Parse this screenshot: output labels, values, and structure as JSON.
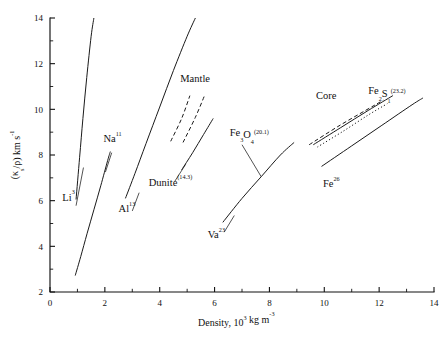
{
  "chart_data": {
    "type": "line",
    "title": "",
    "xlabel": "Density, 10^3 kg m^-3",
    "ylabel": "(κ_s/ρ) km s^-1",
    "xlim": [
      0,
      14
    ],
    "ylim": [
      2,
      14
    ],
    "xticks": [
      0,
      2,
      4,
      6,
      8,
      10,
      12,
      14
    ],
    "xticks_minor": [
      1,
      3,
      5,
      7,
      9,
      11,
      13
    ],
    "yticks": [
      2,
      4,
      6,
      8,
      10,
      12,
      14
    ],
    "yticks_minor": [
      3,
      5,
      7,
      9,
      11,
      13
    ],
    "grid": false,
    "legend": "none (inline labels with leader lines)",
    "series": [
      {
        "name": "Li3",
        "style": "solid",
        "points": [
          [
            0.95,
            6.05
          ],
          [
            1.08,
            7.9
          ],
          [
            1.2,
            9.6
          ],
          [
            1.34,
            11.4
          ],
          [
            1.5,
            13.2
          ],
          [
            1.6,
            14.0
          ]
        ]
      },
      {
        "name": "Na11",
        "style": "solid",
        "points": [
          [
            0.92,
            2.72
          ],
          [
            1.12,
            3.55
          ],
          [
            1.35,
            4.55
          ],
          [
            1.6,
            5.6
          ],
          [
            1.85,
            6.65
          ],
          [
            2.1,
            7.75
          ],
          [
            2.2,
            8.15
          ]
        ]
      },
      {
        "name": "Al13",
        "style": "solid",
        "points": [
          [
            2.75,
            6.1
          ],
          [
            3.1,
            7.2
          ],
          [
            3.5,
            8.5
          ],
          [
            4.0,
            10.1
          ],
          [
            4.5,
            11.7
          ],
          [
            5.0,
            13.2
          ],
          [
            5.3,
            14.0
          ]
        ]
      },
      {
        "name": "Mantle-upper-dashed",
        "style": "dashed",
        "points": [
          [
            4.4,
            8.6
          ],
          [
            4.8,
            9.6
          ],
          [
            5.1,
            10.6
          ]
        ]
      },
      {
        "name": "Mantle-lower-dashed",
        "style": "dashed",
        "points": [
          [
            4.85,
            8.55
          ],
          [
            5.3,
            9.65
          ],
          [
            5.65,
            10.65
          ]
        ]
      },
      {
        "name": "Dunite(14.3)",
        "style": "solid",
        "points": [
          [
            4.8,
            7.35
          ],
          [
            5.2,
            8.1
          ],
          [
            5.6,
            8.9
          ],
          [
            5.95,
            9.6
          ]
        ]
      },
      {
        "name": "Va23",
        "style": "solid",
        "points": [
          [
            6.3,
            5.05
          ],
          [
            7.0,
            6.1
          ],
          [
            7.7,
            7.05
          ],
          [
            8.4,
            8.0
          ],
          [
            8.9,
            8.55
          ]
        ]
      },
      {
        "name": "Core-upper-dashed",
        "style": "dashed",
        "points": [
          [
            9.45,
            8.45
          ],
          [
            10.5,
            9.25
          ],
          [
            11.5,
            9.95
          ],
          [
            12.15,
            10.4
          ]
        ]
      },
      {
        "name": "Core-solid",
        "style": "solid",
        "points": [
          [
            9.6,
            8.45
          ],
          [
            10.6,
            9.2
          ],
          [
            11.6,
            9.95
          ],
          [
            12.5,
            10.6
          ]
        ]
      },
      {
        "name": "Core-dotted",
        "style": "dotted",
        "points": [
          [
            9.75,
            8.35
          ],
          [
            10.7,
            9.05
          ],
          [
            11.6,
            9.75
          ],
          [
            12.3,
            10.25
          ]
        ]
      },
      {
        "name": "Fe26",
        "style": "solid",
        "points": [
          [
            9.9,
            7.5
          ],
          [
            11.0,
            8.4
          ],
          [
            12.1,
            9.3
          ],
          [
            13.2,
            10.2
          ],
          [
            13.6,
            10.5
          ]
        ]
      }
    ],
    "annotations": [
      {
        "id": "li",
        "text_parts": [
          {
            "t": "Li",
            "s": "base"
          },
          {
            "t": "3",
            "s": "sup"
          }
        ],
        "plain": "Li3",
        "x": 0.45,
        "y": 6.0,
        "leader_from": [
          0.95,
          5.78
        ],
        "leader_to": [
          1.22,
          7.45
        ]
      },
      {
        "id": "na",
        "text_parts": [
          {
            "t": "Na",
            "s": "base"
          },
          {
            "t": "11",
            "s": "sup"
          }
        ],
        "plain": "Na11",
        "x": 1.95,
        "y": 8.55,
        "leader_from": [
          2.25,
          8.1
        ],
        "leader_to": [
          2.02,
          7.25
        ]
      },
      {
        "id": "al",
        "text_parts": [
          {
            "t": "Al",
            "s": "base"
          },
          {
            "t": "13",
            "s": "sup"
          }
        ],
        "plain": "Al13",
        "x": 2.5,
        "y": 5.5,
        "leader_from": [
          3.0,
          5.55
        ],
        "leader_to": [
          3.25,
          6.35
        ]
      },
      {
        "id": "mantle",
        "text_parts": [
          {
            "t": "Mantle",
            "s": "base"
          }
        ],
        "plain": "Mantle",
        "x": 4.75,
        "y": 11.2,
        "leader_from": null,
        "leader_to": null
      },
      {
        "id": "dunite",
        "text_parts": [
          {
            "t": "Dunite",
            "s": "base"
          },
          {
            "t": "(14.3)",
            "s": "sup"
          }
        ],
        "plain": "Dunite(14.3)",
        "x": 3.6,
        "y": 6.65,
        "leader_from": [
          4.55,
          6.85
        ],
        "leader_to": [
          4.95,
          7.6
        ]
      },
      {
        "id": "fe3o4",
        "text_parts": [
          {
            "t": "Fe",
            "s": "base"
          },
          {
            "t": "3",
            "s": "sub"
          },
          {
            "t": "O",
            "s": "base"
          },
          {
            "t": "4",
            "s": "sub"
          },
          {
            "t": "(20.1)",
            "s": "sup"
          }
        ],
        "plain": "Fe3O4(20.1)",
        "x": 6.55,
        "y": 8.85,
        "leader_from": [
          7.0,
          8.45
        ],
        "leader_to": [
          7.7,
          7.05
        ]
      },
      {
        "id": "va",
        "text_parts": [
          {
            "t": "Va",
            "s": "base"
          },
          {
            "t": "23",
            "s": "sup"
          }
        ],
        "plain": "Va23",
        "x": 5.75,
        "y": 4.35,
        "leader_from": [
          6.35,
          4.62
        ],
        "leader_to": [
          6.72,
          5.35
        ]
      },
      {
        "id": "core",
        "text_parts": [
          {
            "t": "Core",
            "s": "base"
          }
        ],
        "plain": "Core",
        "x": 9.7,
        "y": 10.45,
        "leader_from": null,
        "leader_to": null
      },
      {
        "id": "fe2s1",
        "text_parts": [
          {
            "t": "Fe",
            "s": "base"
          },
          {
            "t": "2",
            "s": "sub"
          },
          {
            "t": "S",
            "s": "base"
          },
          {
            "t": "1",
            "s": "sub"
          },
          {
            "t": "(23.2)",
            "s": "sup"
          }
        ],
        "plain": "Fe2S1(23.2)",
        "x": 11.6,
        "y": 10.65,
        "leader_from": null,
        "leader_to": null
      },
      {
        "id": "fe26",
        "text_parts": [
          {
            "t": "Fe",
            "s": "base"
          },
          {
            "t": "26",
            "s": "sup"
          }
        ],
        "plain": "Fe26",
        "x": 9.95,
        "y": 6.6,
        "leader_from": null,
        "leader_to": null
      }
    ]
  },
  "axes": {
    "x_title_parts": [
      {
        "t": "Density, 10",
        "s": "base"
      },
      {
        "t": "3",
        "s": "sup"
      },
      {
        "t": " kg m",
        "s": "base"
      },
      {
        "t": "-3",
        "s": "sup"
      }
    ],
    "y_title_parts": [
      {
        "t": "(κ",
        "s": "base"
      },
      {
        "t": "s",
        "s": "sub"
      },
      {
        "t": "/ρ) km s",
        "s": "base"
      },
      {
        "t": "-1",
        "s": "sup"
      }
    ],
    "x_tick_labels": [
      "0",
      "2",
      "4",
      "6",
      "8",
      "10",
      "12",
      "14"
    ],
    "y_tick_labels": [
      "2",
      "4",
      "6",
      "8",
      "10",
      "12",
      "14"
    ]
  },
  "style": {
    "ink": "#111111",
    "background": "#ffffff"
  }
}
